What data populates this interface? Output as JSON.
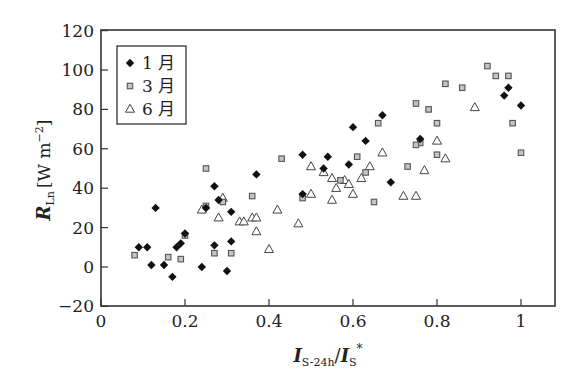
{
  "chart_data": {
    "type": "scatter",
    "title": "",
    "xlabel": "I_S-24h / I_S*",
    "ylabel": "R_Ln [W m^-2]",
    "xlim": [
      0,
      1.08
    ],
    "ylim": [
      -20,
      120
    ],
    "grid": false,
    "legend_position": "upper left",
    "x_ticks": [
      0,
      0.2,
      0.4,
      0.6,
      0.8,
      1
    ],
    "x_tick_labels": [
      "0",
      "0.2",
      "0.4",
      "0.6",
      "0.8",
      "1"
    ],
    "y_ticks": [
      -20,
      0,
      20,
      40,
      60,
      80,
      100,
      120
    ],
    "y_tick_labels": [
      "−20",
      "0",
      "20",
      "40",
      "60",
      "80",
      "100",
      "120"
    ],
    "series": [
      {
        "name": "1月",
        "marker": "diamond",
        "color": "#111111",
        "points": [
          [
            0.09,
            10
          ],
          [
            0.11,
            10
          ],
          [
            0.13,
            30
          ],
          [
            0.12,
            1
          ],
          [
            0.15,
            1
          ],
          [
            0.17,
            -5
          ],
          [
            0.18,
            10
          ],
          [
            0.19,
            12
          ],
          [
            0.2,
            17
          ],
          [
            0.24,
            0
          ],
          [
            0.25,
            30
          ],
          [
            0.27,
            11
          ],
          [
            0.27,
            41
          ],
          [
            0.28,
            34
          ],
          [
            0.3,
            -2
          ],
          [
            0.31,
            13
          ],
          [
            0.31,
            28
          ],
          [
            0.37,
            47
          ],
          [
            0.48,
            37
          ],
          [
            0.48,
            57
          ],
          [
            0.53,
            50
          ],
          [
            0.54,
            56
          ],
          [
            0.59,
            52
          ],
          [
            0.6,
            71
          ],
          [
            0.63,
            64
          ],
          [
            0.67,
            77
          ],
          [
            0.69,
            43
          ],
          [
            0.76,
            65
          ],
          [
            0.96,
            87
          ],
          [
            0.97,
            91
          ],
          [
            1.0,
            82
          ]
        ]
      },
      {
        "name": "3月",
        "marker": "square",
        "color": "#bfbfbf",
        "edge_color": "#555555",
        "points": [
          [
            0.08,
            6
          ],
          [
            0.16,
            5
          ],
          [
            0.19,
            4
          ],
          [
            0.2,
            16
          ],
          [
            0.25,
            50
          ],
          [
            0.25,
            31
          ],
          [
            0.27,
            7
          ],
          [
            0.29,
            33
          ],
          [
            0.31,
            7
          ],
          [
            0.36,
            36
          ],
          [
            0.43,
            55
          ],
          [
            0.48,
            35
          ],
          [
            0.57,
            44
          ],
          [
            0.61,
            56
          ],
          [
            0.63,
            48
          ],
          [
            0.65,
            33
          ],
          [
            0.66,
            73
          ],
          [
            0.73,
            51
          ],
          [
            0.75,
            83
          ],
          [
            0.76,
            63
          ],
          [
            0.78,
            80
          ],
          [
            0.8,
            73
          ],
          [
            0.82,
            93
          ],
          [
            0.86,
            91
          ],
          [
            0.92,
            102
          ],
          [
            0.94,
            97
          ],
          [
            0.97,
            97
          ],
          [
            0.98,
            73
          ],
          [
            1.0,
            58
          ],
          [
            0.75,
            62
          ],
          [
            0.8,
            57
          ]
        ]
      },
      {
        "name": "6月",
        "marker": "triangle-open",
        "color": "#555555",
        "points": [
          [
            0.24,
            29
          ],
          [
            0.28,
            25
          ],
          [
            0.29,
            35
          ],
          [
            0.33,
            23
          ],
          [
            0.34,
            23
          ],
          [
            0.36,
            25
          ],
          [
            0.37,
            25
          ],
          [
            0.37,
            18
          ],
          [
            0.4,
            9
          ],
          [
            0.42,
            29
          ],
          [
            0.47,
            22
          ],
          [
            0.5,
            37
          ],
          [
            0.5,
            51
          ],
          [
            0.55,
            45
          ],
          [
            0.55,
            34
          ],
          [
            0.56,
            40
          ],
          [
            0.58,
            44
          ],
          [
            0.59,
            42
          ],
          [
            0.6,
            37
          ],
          [
            0.64,
            51
          ],
          [
            0.67,
            58
          ],
          [
            0.72,
            36
          ],
          [
            0.75,
            36
          ],
          [
            0.77,
            49
          ],
          [
            0.8,
            64
          ],
          [
            0.82,
            55
          ],
          [
            0.89,
            81
          ],
          [
            0.53,
            48
          ],
          [
            0.62,
            45
          ]
        ]
      }
    ],
    "legend": [
      {
        "marker": "diamond",
        "label": "1 月"
      },
      {
        "marker": "square",
        "label": "3 月"
      },
      {
        "marker": "triangle-open",
        "label": "6 月"
      }
    ],
    "axis_title_parts": {
      "y_main": "R",
      "y_sub": "Ln",
      "y_unit": "[W m",
      "y_unit_sup": "−2",
      "y_unit_close": "]",
      "x_main1": "I",
      "x_sub1": "S-24h",
      "x_slash": "/",
      "x_main2": "I",
      "x_sub2": "S",
      "x_sup2": "*"
    }
  }
}
